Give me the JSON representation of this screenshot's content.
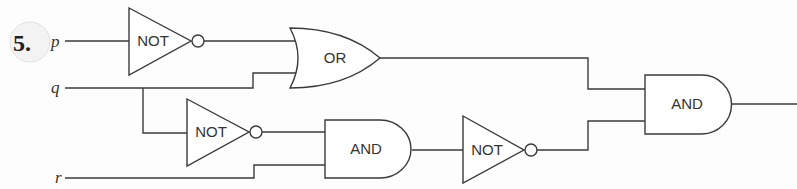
{
  "problem": {
    "number": "5."
  },
  "inputs": [
    {
      "name": "p"
    },
    {
      "name": "q"
    },
    {
      "name": "r"
    }
  ],
  "gates": [
    {
      "id": "not1",
      "type": "NOT",
      "label": "NOT",
      "inputs": [
        "p"
      ]
    },
    {
      "id": "or1",
      "type": "OR",
      "label": "OR",
      "inputs": [
        "not1",
        "q"
      ]
    },
    {
      "id": "not2",
      "type": "NOT",
      "label": "NOT",
      "inputs": [
        "q"
      ]
    },
    {
      "id": "and1",
      "type": "AND",
      "label": "AND",
      "inputs": [
        "not2",
        "r"
      ]
    },
    {
      "id": "not3",
      "type": "NOT",
      "label": "NOT",
      "inputs": [
        "and1"
      ]
    },
    {
      "id": "and2",
      "type": "AND",
      "label": "AND",
      "inputs": [
        "or1",
        "not3"
      ]
    }
  ],
  "colors": {
    "line": "#3a3a3a",
    "background": "#fdfdfd"
  }
}
